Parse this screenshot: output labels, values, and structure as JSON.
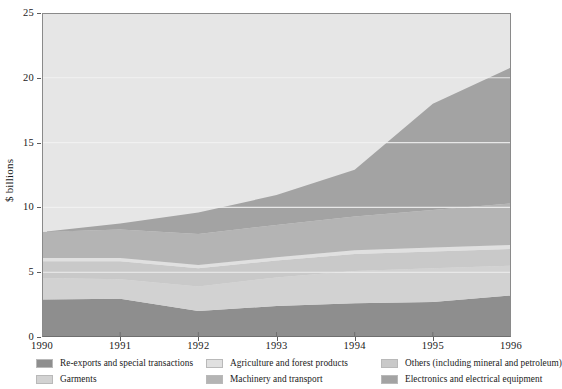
{
  "axes": {
    "ylabel": "$ billions",
    "yticks": [
      0,
      5,
      10,
      15,
      20,
      25
    ],
    "xticks": [
      "1990",
      "1991",
      "1992",
      "1993",
      "1994",
      "1995",
      "1996"
    ]
  },
  "legend": {
    "items": [
      {
        "label": "Re-exports and special transactions",
        "color": "#8e8e8e"
      },
      {
        "label": "Garments",
        "color": "#d2d2d2"
      },
      {
        "label": "Agriculture and forest products",
        "color": "#e0e0e0"
      },
      {
        "label": "Machinery and transport",
        "color": "#b4b4b4"
      },
      {
        "label": "Others (including mineral and petroleum)",
        "color": "#c9c9c9"
      },
      {
        "label": "Electronics and electrical equipment",
        "color": "#a3a3a3"
      }
    ]
  },
  "chart_data": {
    "type": "area",
    "title": "",
    "xlabel": "",
    "ylabel": "$ billions",
    "ylim": [
      0,
      25
    ],
    "grid": true,
    "legend_position": "bottom",
    "x": [
      1990,
      1991,
      1992,
      1993,
      1994,
      1995,
      1996
    ],
    "categories": [
      "1990",
      "1991",
      "1992",
      "1993",
      "1994",
      "1995",
      "1996"
    ],
    "stacked": true,
    "series": [
      {
        "name": "Re-exports and special transactions",
        "color": "#8e8e8e",
        "values": [
          2.9,
          2.95,
          2.0,
          2.4,
          2.6,
          2.7,
          3.2
        ]
      },
      {
        "name": "Garments",
        "color": "#d2d2d2",
        "values": [
          1.65,
          1.5,
          1.9,
          2.2,
          2.5,
          2.6,
          2.3
        ]
      },
      {
        "name": "Others (including mineral and petroleum)",
        "color": "#c9c9c9",
        "values": [
          1.3,
          1.4,
          1.4,
          1.3,
          1.3,
          1.3,
          1.3
        ]
      },
      {
        "name": "Agriculture and forest products",
        "color": "#e0e0e0",
        "values": [
          0.25,
          0.25,
          0.25,
          0.25,
          0.3,
          0.3,
          0.3
        ]
      },
      {
        "name": "Machinery and transport",
        "color": "#b4b4b4",
        "values": [
          2.0,
          2.2,
          2.4,
          2.5,
          2.6,
          2.9,
          3.2
        ]
      },
      {
        "name": "Electronics and electrical equipment",
        "color": "#a3a3a3",
        "values": [
          0.0,
          0.45,
          1.65,
          2.3,
          3.6,
          8.2,
          10.5
        ]
      }
    ],
    "totals": [
      8.1,
      8.75,
      9.6,
      11.0,
      12.9,
      18.0,
      20.8
    ],
    "boundaries_1990": [
      0,
      2.9,
      4.55,
      5.85,
      6.1,
      8.1,
      8.1
    ],
    "boundaries_1996": [
      0,
      3.2,
      5.5,
      6.8,
      7.1,
      10.3,
      20.8
    ]
  }
}
